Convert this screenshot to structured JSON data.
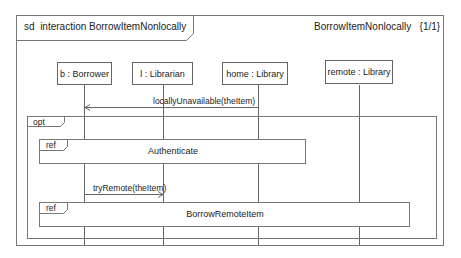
{
  "diagram": {
    "type": "UML sequence diagram",
    "frame": {
      "kind": "sd",
      "title": "interaction BorrowItemNonlocally",
      "right_title": "BorrowItemNonlocally",
      "page": "{1/1}"
    },
    "lifelines": [
      {
        "id": "b",
        "label": "b : Borrower"
      },
      {
        "id": "l",
        "label": "l : Librarian"
      },
      {
        "id": "home",
        "label": "home : Library"
      },
      {
        "id": "remote",
        "label": "remote : Library"
      }
    ],
    "messages": [
      {
        "label": "locallyUnavailable(theItem)",
        "from": "home",
        "to": "b"
      },
      {
        "label": "tryRemote(theItem)",
        "from": "b",
        "to": "l"
      }
    ],
    "fragments": [
      {
        "operator": "opt"
      }
    ],
    "refs": [
      {
        "keyword": "ref",
        "label": "Authenticate"
      },
      {
        "keyword": "ref",
        "label": "BorrowRemoteItem"
      }
    ],
    "colors": {
      "line": "#666666",
      "background": "#ffffff"
    }
  }
}
